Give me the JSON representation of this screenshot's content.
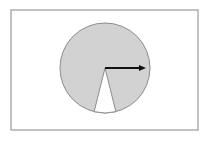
{
  "figure": {
    "title": "Circle with removed sector and radius arrow",
    "canvas": {
      "width": 210,
      "height": 142,
      "background_color": "#ffffff"
    },
    "frame": {
      "name": "figure-border",
      "x": 11,
      "y": 10,
      "width": 187,
      "height": 120,
      "stroke_color": "#9a9a9a",
      "stroke_width": 1.2,
      "fill_color": "#ffffff"
    },
    "circle": {
      "name": "shaded-disc",
      "center_x": 105,
      "center_y": 68,
      "radius": 45,
      "fill_color": "#d2d2d2",
      "stroke_color": "#8c8c8c",
      "stroke_width": 1
    },
    "sector_cutout": {
      "name": "white-wedge",
      "apex_x": 105,
      "apex_y": 68,
      "start_angle_deg": -104,
      "end_angle_deg": -76,
      "sweep_deg": 28,
      "fill_color": "#ffffff",
      "stroke_color": "#8c8c8c",
      "stroke_width": 1,
      "leg_left_x": 94,
      "leg_left_y": 111.7,
      "leg_right_x": 116,
      "leg_right_y": 111.7
    },
    "arrow": {
      "name": "radius-arrow",
      "start_x": 105,
      "start_y": 68,
      "end_x": 146,
      "end_y": 68,
      "angle_deg": 0,
      "length": 41,
      "color": "#111111",
      "line_width": 2,
      "head_length": 7,
      "head_width": 6
    }
  }
}
